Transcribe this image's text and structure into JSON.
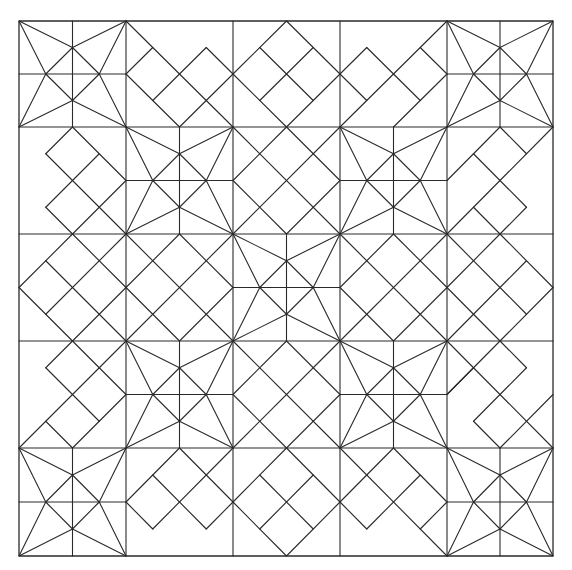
{
  "grid": {
    "rows": 5,
    "cols": 5,
    "units_per_cell": 4
  },
  "colors": {
    "line": "#2a2a2a",
    "background": "#ffffff"
  },
  "layout_cells": [
    [
      "star",
      "dA",
      "dB",
      "dC",
      "star"
    ],
    [
      "dD",
      "star",
      "dX",
      "star",
      "dE"
    ],
    [
      "dF",
      "dX",
      "star",
      "dX",
      "dG"
    ],
    [
      "dH",
      "star",
      "dX",
      "star",
      "dI"
    ],
    [
      "star",
      "dJ",
      "dB",
      "dK",
      "star"
    ]
  ],
  "motifs": {
    "star": [
      [
        2,
        0,
        2,
        4
      ],
      [
        0,
        2,
        4,
        2
      ],
      [
        0,
        0,
        2,
        1
      ],
      [
        0,
        0,
        1,
        2
      ],
      [
        4,
        0,
        2,
        1
      ],
      [
        4,
        0,
        3,
        2
      ],
      [
        4,
        4,
        3,
        2
      ],
      [
        4,
        4,
        2,
        3
      ],
      [
        0,
        4,
        2,
        3
      ],
      [
        0,
        4,
        1,
        2
      ],
      [
        2,
        1,
        3,
        2
      ],
      [
        3,
        2,
        2,
        3
      ],
      [
        2,
        3,
        1,
        2
      ],
      [
        1,
        2,
        2,
        1
      ]
    ],
    "dA": [
      [
        0,
        0,
        4,
        4
      ],
      [
        0,
        2,
        1,
        1
      ],
      [
        0,
        2,
        2,
        4
      ],
      [
        1,
        3,
        3,
        1
      ],
      [
        3,
        1,
        4,
        2
      ],
      [
        2,
        4,
        4,
        2
      ]
    ],
    "dB": [
      [
        2,
        0,
        4,
        2
      ],
      [
        4,
        2,
        2,
        4
      ],
      [
        2,
        4,
        0,
        2
      ],
      [
        0,
        2,
        2,
        0
      ],
      [
        1,
        1,
        3,
        3
      ],
      [
        3,
        1,
        1,
        3
      ]
    ],
    "dC": [
      [
        4,
        0,
        0,
        4
      ],
      [
        4,
        2,
        3,
        1
      ],
      [
        4,
        2,
        2,
        4
      ],
      [
        1,
        1,
        3,
        3
      ],
      [
        1,
        1,
        0,
        2
      ],
      [
        0,
        2,
        1,
        3
      ]
    ],
    "dD": [
      [
        2,
        0,
        1,
        1
      ],
      [
        2,
        0,
        4,
        2
      ],
      [
        1,
        1,
        4,
        4
      ],
      [
        3,
        1,
        1,
        3
      ],
      [
        1,
        3,
        2,
        4
      ],
      [
        4,
        2,
        2,
        4
      ]
    ],
    "dE": [
      [
        4,
        0,
        0,
        4
      ],
      [
        2,
        0,
        1,
        1
      ],
      [
        2,
        0,
        3,
        1
      ],
      [
        1,
        1,
        3,
        3
      ],
      [
        1,
        1,
        0,
        2
      ],
      [
        3,
        3,
        2,
        4
      ],
      [
        1,
        3,
        2,
        4
      ]
    ],
    "dF": [
      [
        2,
        0,
        0,
        2
      ],
      [
        0,
        2,
        2,
        4
      ],
      [
        4,
        0,
        1,
        3
      ],
      [
        1,
        1,
        4,
        4
      ],
      [
        2,
        0,
        4,
        2
      ],
      [
        2,
        4,
        4,
        2
      ]
    ],
    "dG": [
      [
        2,
        0,
        4,
        2
      ],
      [
        4,
        2,
        2,
        4
      ],
      [
        0,
        4,
        3,
        1
      ],
      [
        0,
        0,
        3,
        3
      ],
      [
        2,
        0,
        0,
        2
      ],
      [
        0,
        2,
        2,
        4
      ]
    ],
    "dH": [
      [
        4,
        0,
        0,
        4
      ],
      [
        2,
        0,
        1,
        1
      ],
      [
        1,
        1,
        3,
        3
      ],
      [
        3,
        3,
        2,
        4
      ],
      [
        2,
        0,
        4,
        2
      ],
      [
        4,
        2,
        3,
        3
      ],
      [
        2,
        4,
        1,
        3
      ]
    ],
    "dI": [
      [
        0,
        0,
        4,
        4
      ],
      [
        2,
        0,
        3,
        1
      ],
      [
        3,
        1,
        1,
        3
      ],
      [
        1,
        3,
        2,
        4
      ],
      [
        2,
        0,
        0,
        2
      ],
      [
        0,
        2,
        1,
        1
      ],
      [
        2,
        4,
        4,
        2
      ]
    ],
    "dJ": [
      [
        2,
        0,
        0,
        2
      ],
      [
        0,
        2,
        1,
        3
      ],
      [
        1,
        3,
        4,
        0
      ],
      [
        2,
        0,
        4,
        2
      ],
      [
        1,
        1,
        3,
        3
      ],
      [
        3,
        3,
        4,
        2
      ]
    ],
    "dK": [
      [
        0,
        0,
        4,
        4
      ],
      [
        2,
        0,
        0,
        2
      ],
      [
        0,
        2,
        1,
        3
      ],
      [
        1,
        3,
        3,
        1
      ],
      [
        2,
        0,
        4,
        2
      ],
      [
        4,
        2,
        3,
        3
      ]
    ],
    "dX": [
      [
        2,
        0,
        4,
        2
      ],
      [
        4,
        2,
        2,
        4
      ],
      [
        2,
        4,
        0,
        2
      ],
      [
        0,
        2,
        2,
        0
      ],
      [
        0,
        0,
        4,
        4
      ],
      [
        4,
        0,
        0,
        4
      ]
    ]
  }
}
